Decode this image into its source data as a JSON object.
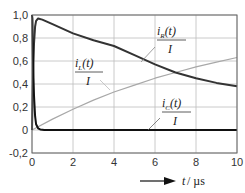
{
  "chart_data": {
    "type": "line",
    "title": "",
    "xlabel": "t / µs",
    "ylabel": "",
    "xlim": [
      0,
      10
    ],
    "ylim": [
      -0.2,
      1.0
    ],
    "grid": true,
    "legend": "inline labels",
    "x_ticks": [
      "0",
      "2",
      "4",
      "6",
      "8",
      "10"
    ],
    "y_ticks": [
      "1,0",
      "0,8",
      "0,6",
      "0,4",
      "0,2",
      "0",
      "-0,2"
    ],
    "series": [
      {
        "name": "i_R(t)/I",
        "label_main": "i",
        "label_sub": "R",
        "label_rest": "(t)",
        "label_den": "I",
        "color": "#333333",
        "width": 2,
        "x": [
          0,
          0.05,
          0.1,
          0.15,
          0.2,
          0.3,
          0.5,
          1,
          2,
          3,
          4,
          5,
          6,
          7,
          8,
          9,
          10
        ],
        "y": [
          0,
          0.45,
          0.75,
          0.9,
          0.95,
          0.97,
          0.96,
          0.92,
          0.84,
          0.78,
          0.73,
          0.65,
          0.57,
          0.5,
          0.45,
          0.41,
          0.38
        ]
      },
      {
        "name": "i_L(t)/I",
        "label_main": "i",
        "label_sub": "L",
        "label_rest": "(t)",
        "label_den": "I",
        "color": "#a8a8a8",
        "width": 1.2,
        "x": [
          0,
          1,
          2,
          3,
          4,
          5,
          6,
          7,
          8,
          9,
          10
        ],
        "y": [
          0,
          0.095,
          0.18,
          0.26,
          0.33,
          0.39,
          0.45,
          0.5,
          0.55,
          0.59,
          0.63
        ]
      },
      {
        "name": "i_C(t)/I",
        "label_main": "i",
        "label_sub": "C",
        "label_rest": "(t)",
        "label_den": "I",
        "color": "#111111",
        "width": 2,
        "x": [
          0,
          0.02,
          0.05,
          0.1,
          0.15,
          0.2,
          0.3,
          0.4,
          0.6,
          1,
          10
        ],
        "y": [
          1.0,
          0.97,
          0.6,
          0.3,
          0.12,
          0.05,
          0.015,
          0.005,
          0,
          0,
          0
        ]
      }
    ]
  },
  "axis": {
    "x_label_var": "t",
    "x_label_unit": " / µs"
  }
}
